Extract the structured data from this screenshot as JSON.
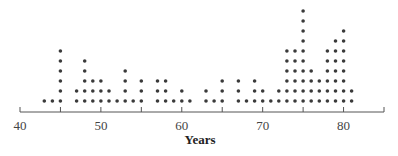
{
  "chart_data": {
    "type": "dot",
    "title": "",
    "xlabel": "Years",
    "ylabel": "",
    "xlim": [
      40,
      85
    ],
    "x_ticks_labeled": [
      40,
      50,
      60,
      70,
      80
    ],
    "x_ticks_minor": [
      45,
      55,
      65,
      75,
      85
    ],
    "grid": false,
    "legend": null,
    "x": [
      43,
      44,
      45,
      47,
      48,
      49,
      50,
      51,
      52,
      53,
      54,
      55,
      57,
      58,
      59,
      60,
      61,
      63,
      64,
      65,
      67,
      68,
      69,
      70,
      71,
      72,
      73,
      74,
      75,
      76,
      77,
      78,
      79,
      80,
      81
    ],
    "counts": [
      1,
      1,
      6,
      2,
      5,
      3,
      3,
      2,
      1,
      4,
      1,
      3,
      3,
      3,
      1,
      2,
      1,
      2,
      1,
      3,
      3,
      1,
      3,
      2,
      1,
      2,
      6,
      6,
      10,
      4,
      3,
      6,
      7,
      8,
      2
    ]
  },
  "style": {
    "dot_color": "#3a3a3a",
    "axis_color": "#555555"
  }
}
